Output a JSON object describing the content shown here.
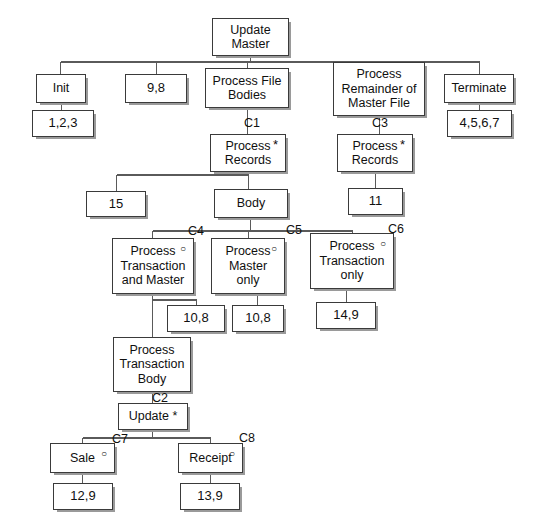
{
  "diagram": {
    "type": "jackson-structure-diagram",
    "colors": {
      "box_border": "#3a3a3a",
      "box_fill": "#ffffff",
      "shadow": "#9a9a9a",
      "line": "#5a5a5a",
      "text": "#101010",
      "background": "#ffffff"
    },
    "markers": {
      "iteration": "*",
      "selection": "○"
    },
    "nodes": [
      {
        "id": "update-master",
        "label": "Update\nMaster",
        "x": 212,
        "y": 18,
        "w": 77,
        "h": 38,
        "marker": "",
        "kind": "process"
      },
      {
        "id": "init",
        "label": "Init",
        "x": 36,
        "y": 74,
        "w": 50,
        "h": 29,
        "marker": "",
        "kind": "process"
      },
      {
        "id": "init-ops",
        "label": "1,2,3",
        "x": 32,
        "y": 110,
        "w": 62,
        "h": 27,
        "marker": "",
        "kind": "leaf"
      },
      {
        "id": "open-files-ops",
        "label": "9,8",
        "x": 125,
        "y": 74,
        "w": 62,
        "h": 29,
        "marker": "",
        "kind": "leaf"
      },
      {
        "id": "process-file-bodies",
        "label": "Process File\nBodies",
        "x": 205,
        "y": 68,
        "w": 84,
        "h": 40,
        "marker": "",
        "kind": "process"
      },
      {
        "id": "process-records-c1",
        "label": "Process\nRecords",
        "x": 210,
        "y": 134,
        "w": 76,
        "h": 38,
        "marker": "*",
        "kind": "process"
      },
      {
        "id": "fifteen",
        "label": "15",
        "x": 86,
        "y": 191,
        "w": 60,
        "h": 26,
        "marker": "",
        "kind": "leaf"
      },
      {
        "id": "body",
        "label": "Body",
        "x": 214,
        "y": 189,
        "w": 74,
        "h": 29,
        "marker": "",
        "kind": "process"
      },
      {
        "id": "process-remainder",
        "label": "Process\nRemainder of\nMaster File",
        "x": 333,
        "y": 62,
        "w": 92,
        "h": 54,
        "marker": "",
        "kind": "process"
      },
      {
        "id": "process-records-c3",
        "label": "Process\nRecords",
        "x": 337,
        "y": 134,
        "w": 76,
        "h": 38,
        "marker": "*",
        "kind": "process"
      },
      {
        "id": "eleven",
        "label": "11",
        "x": 348,
        "y": 188,
        "w": 55,
        "h": 27,
        "marker": "",
        "kind": "leaf"
      },
      {
        "id": "terminate",
        "label": "Terminate",
        "x": 444,
        "y": 74,
        "w": 70,
        "h": 29,
        "marker": "",
        "kind": "process"
      },
      {
        "id": "terminate-ops",
        "label": "4,5,6,7",
        "x": 447,
        "y": 110,
        "w": 65,
        "h": 27,
        "marker": "",
        "kind": "leaf"
      },
      {
        "id": "process-txn-and-master",
        "label": "Process\nTransaction\nand Master",
        "x": 112,
        "y": 238,
        "w": 82,
        "h": 56,
        "marker": "○",
        "kind": "process"
      },
      {
        "id": "process-master-only",
        "label": "Process\nMaster\nonly",
        "x": 211,
        "y": 238,
        "w": 74,
        "h": 56,
        "marker": "○",
        "kind": "process"
      },
      {
        "id": "process-txn-only",
        "label": "Process\nTransaction\nonly",
        "x": 310,
        "y": 233,
        "w": 84,
        "h": 56,
        "marker": "○",
        "kind": "process"
      },
      {
        "id": "ops-10-8-left",
        "label": "10,8",
        "x": 167,
        "y": 305,
        "w": 58,
        "h": 27,
        "marker": "",
        "kind": "leaf"
      },
      {
        "id": "ops-10-8-right",
        "label": "10,8",
        "x": 232,
        "y": 305,
        "w": 52,
        "h": 27,
        "marker": "",
        "kind": "leaf"
      },
      {
        "id": "ops-14-9",
        "label": "14,9",
        "x": 316,
        "y": 302,
        "w": 60,
        "h": 27,
        "marker": "",
        "kind": "leaf"
      },
      {
        "id": "process-txn-body",
        "label": "Process\nTransaction\nBody",
        "x": 113,
        "y": 337,
        "w": 78,
        "h": 55,
        "marker": "",
        "kind": "process"
      },
      {
        "id": "update",
        "label": "Update *",
        "x": 118,
        "y": 403,
        "w": 70,
        "h": 27,
        "marker": "",
        "kind": "process"
      },
      {
        "id": "sale",
        "label": "Sale",
        "x": 50,
        "y": 443,
        "w": 65,
        "h": 30,
        "marker": "○",
        "kind": "process"
      },
      {
        "id": "ops-12-9",
        "label": "12,9",
        "x": 53,
        "y": 483,
        "w": 60,
        "h": 27,
        "marker": "",
        "kind": "leaf"
      },
      {
        "id": "receipt",
        "label": "Receipt",
        "x": 178,
        "y": 443,
        "w": 65,
        "h": 30,
        "marker": "○",
        "kind": "process"
      },
      {
        "id": "ops-13-9",
        "label": "13,9",
        "x": 180,
        "y": 483,
        "w": 60,
        "h": 27,
        "marker": "",
        "kind": "leaf"
      }
    ],
    "condition_labels": [
      {
        "id": "c1",
        "text": "C1",
        "x": 244,
        "y": 117
      },
      {
        "id": "c2",
        "text": "C2",
        "x": 152,
        "y": 392
      },
      {
        "id": "c3",
        "text": "C3",
        "x": 372,
        "y": 117
      },
      {
        "id": "c4",
        "text": "C4",
        "x": 188,
        "y": 225
      },
      {
        "id": "c5",
        "text": "C5",
        "x": 286,
        "y": 224
      },
      {
        "id": "c6",
        "text": "C6",
        "x": 388,
        "y": 223
      },
      {
        "id": "c7",
        "text": "C7",
        "x": 112,
        "y": 433
      },
      {
        "id": "c8",
        "text": "C8",
        "x": 239,
        "y": 432
      }
    ],
    "connectors": [
      "update-master-bus",
      "process-file-bodies-to-records",
      "process-records-to-body-and-15",
      "body-to-selection-bus",
      "process-remainder-to-records",
      "process-records-c3-to-11",
      "terminate-to-ops",
      "init-to-ops",
      "txn-and-master-to-10-8-and-body",
      "master-only-to-10-8",
      "txn-only-to-14-9",
      "txn-body-to-update",
      "update-to-sale-receipt-bus",
      "sale-to-12-9",
      "receipt-to-13-9"
    ]
  }
}
